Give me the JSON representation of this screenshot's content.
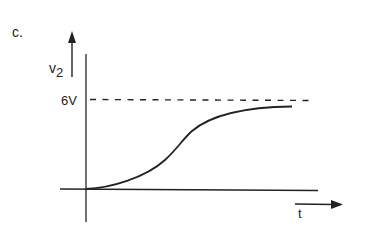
{
  "figure": {
    "panel_label": "c.",
    "y_axis_label_main": "v",
    "y_axis_label_sub": "2",
    "asymptote_label": "6V",
    "x_axis_label": "t",
    "asymptote_value": 6,
    "asymptote_unit": "V",
    "curve_description": "S-shaped rise from 0 approaching 6V asymptotically",
    "line_color": "#222222"
  }
}
